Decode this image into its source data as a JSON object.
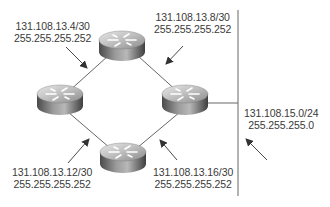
{
  "diagram": {
    "title": "",
    "colors": {
      "line": "#555555",
      "arrow": "#333333",
      "text": "#3a3a3a",
      "router_dark": "#5c5c5c",
      "router_light": "#d9d9d9"
    },
    "nodes": [
      {
        "id": "router-top",
        "type": "router"
      },
      {
        "id": "router-left",
        "type": "router"
      },
      {
        "id": "router-right",
        "type": "router"
      },
      {
        "id": "router-bottom",
        "type": "router"
      },
      {
        "id": "lan-segment",
        "type": "ethernet-segment"
      }
    ],
    "links": [
      {
        "from": "router-left",
        "to": "router-top",
        "network": "131.108.13.4/30",
        "mask": "255.255.255.252"
      },
      {
        "from": "router-top",
        "to": "router-right",
        "network": "131.108.13.8/30",
        "mask": "255.255.255.252"
      },
      {
        "from": "router-left",
        "to": "router-bottom",
        "network": "131.108.13.12/30",
        "mask": "255.255.255.252"
      },
      {
        "from": "router-bottom",
        "to": "router-right",
        "network": "131.108.13.16/30",
        "mask": "255.255.255.252"
      },
      {
        "from": "router-right",
        "to": "lan-segment",
        "network": "131.108.15.0/24",
        "mask": "255.255.255.0"
      }
    ],
    "labels": {
      "top_left": {
        "network": "131.108.13.4/30",
        "mask": "255.255.255.252"
      },
      "top_right": {
        "network": "131.108.13.8/30",
        "mask": "255.255.255.252"
      },
      "bottom_left": {
        "network": "131.108.13.12/30",
        "mask": "255.255.255.252"
      },
      "bottom_right": {
        "network": "131.108.13.16/30",
        "mask": "255.255.255.252"
      },
      "lan": {
        "network": "131.108.15.0/24",
        "mask": "255.255.255.0"
      }
    }
  }
}
